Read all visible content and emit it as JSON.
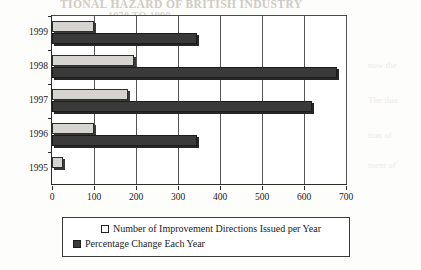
{
  "background_text": {
    "heading_line1": "TIONAL HAZARD OF BRITISH INDUSTRY",
    "heading_line2": "1970 TO 1999",
    "faint_rows": [
      "now the",
      "The this",
      "tion of",
      "ment of"
    ]
  },
  "legend": {
    "items": [
      {
        "label": "Number of Improvement Directions Issued per Year",
        "swatch": "light-swatch",
        "color": "#ffffff"
      },
      {
        "label": "Percentage Change Each Year",
        "swatch": "dark-swatch",
        "color": "#3a3a3a"
      }
    ]
  },
  "chart_data": {
    "type": "bar",
    "orientation": "horizontal",
    "title": "",
    "xlabel": "",
    "ylabel": "",
    "categories": [
      "1999",
      "1998",
      "1997",
      "1996",
      "1995"
    ],
    "xlim": [
      0,
      700
    ],
    "xticks": [
      0,
      100,
      200,
      300,
      400,
      500,
      600,
      700
    ],
    "xtick_labels": [
      "0",
      "100",
      "200",
      "300",
      "400",
      "500",
      "600",
      "700"
    ],
    "grid": true,
    "grid_axis": "x",
    "legend_position": "bottom",
    "series": [
      {
        "name": "Number of Improvement Directions Issued per Year",
        "color": "#d6d4d0",
        "values": [
          100,
          195,
          180,
          100,
          25
        ]
      },
      {
        "name": "Percentage Change Each Year",
        "color": "#3a3a3a",
        "values": [
          345,
          678,
          620,
          345,
          0
        ]
      }
    ]
  }
}
